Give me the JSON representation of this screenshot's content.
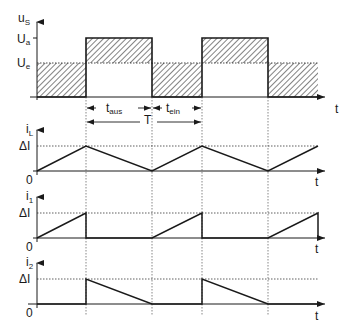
{
  "diagram": {
    "title": "",
    "colors": {
      "ink": "#1a1a1a",
      "grid": "#555555"
    },
    "top_plot": {
      "y_label": "u",
      "y_label_sub": "S",
      "levels": [
        {
          "name": "U_a",
          "main": "U",
          "sub": "a"
        },
        {
          "name": "U_e",
          "main": "U",
          "sub": "e"
        }
      ],
      "x_label": "t",
      "intervals": {
        "t_off": {
          "main": "t",
          "sub": "aus"
        },
        "t_on": {
          "main": "t",
          "sub": "ein"
        },
        "period": "T"
      }
    },
    "plots": [
      {
        "id": "iL",
        "y_label": "i",
        "y_label_sub": "L",
        "level_label": "ΔI",
        "zero_label": "0",
        "x_label": "t",
        "shape": "triangle"
      },
      {
        "id": "i1",
        "y_label": "i",
        "y_label_sub": "1",
        "level_label": "ΔI",
        "zero_label": "0",
        "x_label": "t",
        "shape": "rising-sawtooth"
      },
      {
        "id": "i2",
        "y_label": "i",
        "y_label_sub": "2",
        "level_label": "ΔI",
        "zero_label": "0",
        "x_label": "t",
        "shape": "falling-sawtooth"
      }
    ]
  }
}
